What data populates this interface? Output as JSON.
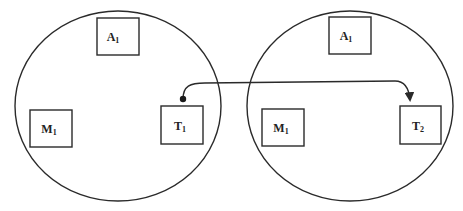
{
  "diagram": {
    "stroke_color": "#2a2a2a",
    "nodes": [
      {
        "id": "node-1",
        "shape": "ellipse",
        "cx": 118,
        "cy": 106,
        "rx": 103,
        "ry": 95,
        "components": [
          {
            "id": "A1-left",
            "base": "A",
            "sub": "1",
            "x": 97,
            "y": 18,
            "w": 42,
            "h": 37
          },
          {
            "id": "M1-left",
            "base": "M",
            "sub": "1",
            "x": 30,
            "y": 110,
            "w": 42,
            "h": 37
          },
          {
            "id": "T1",
            "base": "T",
            "sub": "1",
            "x": 161,
            "y": 106,
            "w": 42,
            "h": 38
          }
        ]
      },
      {
        "id": "node-2",
        "shape": "ellipse",
        "cx": 350,
        "cy": 106,
        "rx": 103,
        "ry": 95,
        "components": [
          {
            "id": "A1-right",
            "base": "A",
            "sub": "1",
            "x": 329,
            "y": 17,
            "w": 42,
            "h": 37
          },
          {
            "id": "M1-right",
            "base": "M",
            "sub": "1",
            "x": 262,
            "y": 109,
            "w": 42,
            "h": 37
          },
          {
            "id": "T2",
            "base": "T",
            "sub": "2",
            "x": 400,
            "y": 106,
            "w": 41,
            "h": 38
          }
        ]
      }
    ],
    "edges": [
      {
        "from": "T1",
        "to": "T2",
        "style": "curved-arrow",
        "start_marker": "dot",
        "end_marker": "arrowhead"
      }
    ]
  }
}
